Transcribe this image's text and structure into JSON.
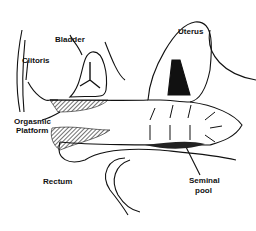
{
  "diagram": {
    "type": "anatomical line drawing",
    "labels": {
      "bladder": "Bladder",
      "uterus": "Uterus",
      "clitoris": "Clitoris",
      "orgasmic_platform_line1": "Orgasmic",
      "orgasmic_platform_line2": "Platform",
      "rectum": "Rectum",
      "seminal_pool_line1": "Seminal",
      "seminal_pool_line2": "pool"
    },
    "colors": {
      "ink": "#111111",
      "background": "#ffffff"
    }
  }
}
